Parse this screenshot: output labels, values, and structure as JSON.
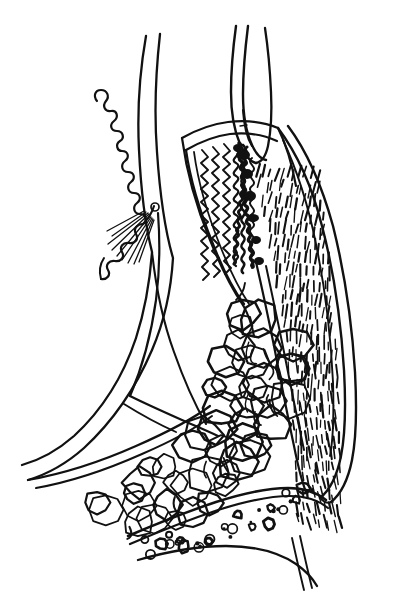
{
  "figure": {
    "kind": "anatomical-line-drawing",
    "style": "black ink pen-and-ink hatching on white",
    "background_color": "#ffffff",
    "ink_color": "#111111",
    "width": 411,
    "height": 602,
    "has_visible_text": false,
    "visible_text": "",
    "caption": ""
  },
  "palette": {
    "background": "#ffffff",
    "ink": "#111111",
    "hatch": "#111111",
    "stipple": "#111111",
    "scribble_band": "#000000"
  },
  "regions": [
    {
      "id": "crenulated-flap",
      "label": "Crenulated wavy flap (upper left)",
      "description": "Scalloped, wavy-edged tissue lobe rising at the upper left of the figure",
      "bbox": [
        88,
        88,
        60,
        180
      ],
      "stroke_width": 2.0
    },
    {
      "id": "long-left-contour",
      "label": "Long sweeping left contour",
      "description": "Double-line contour sweeping from the top center down and left to the lower left corner",
      "bbox": [
        18,
        35,
        180,
        430
      ],
      "stroke_width": 2.2
    },
    {
      "id": "radiating-rays",
      "label": "Fan of radiating short lines",
      "description": "Short straight rays fanning downward-left from a small node",
      "bbox": [
        100,
        205,
        45,
        55
      ],
      "ray_count": 9
    },
    {
      "id": "small-node",
      "label": "Small open circle node",
      "description": "Tiny open circle marker at the hinge of the fan of rays",
      "bbox": [
        151,
        203,
        9,
        9
      ]
    },
    {
      "id": "upper-tube",
      "label": "Tubular structure entering from top",
      "description": "Narrow double-walled tube descending from the top edge and curving back up",
      "bbox": [
        226,
        28,
        48,
        160
      ],
      "stroke_width": 2.2
    },
    {
      "id": "mucosal-folds",
      "label": "Wavy mucosal folds (zigzag lines)",
      "description": "Three nested zigzag/serpentine lines running diagonally down-right inside the wall",
      "bbox": [
        185,
        140,
        90,
        120
      ],
      "fold_count": 3
    },
    {
      "id": "scribble-band",
      "label": "Dense black scribbled band",
      "description": "Heavy irregular black scribble marking a thickened transition zone",
      "bbox": [
        232,
        140,
        42,
        145
      ]
    },
    {
      "id": "hatched-muscle",
      "label": "Hatched muscle layer",
      "description": "Wide band of short parallel dashes in many rows, angled, filling the right wall",
      "bbox": [
        248,
        160,
        110,
        370
      ],
      "row_count": 26,
      "dashes_per_row": 11
    },
    {
      "id": "right-outer-wall",
      "label": "Right outer wall double contour",
      "description": "Two long parallel contour lines forming the outer boundary on the right",
      "bbox": [
        255,
        60,
        130,
        470
      ],
      "stroke_width": 2.2
    },
    {
      "id": "fat-lobules",
      "label": "Lobular fat tissue",
      "description": "Cluster of rounded bubble-like lobules filling the lower central area",
      "bbox": [
        110,
        300,
        180,
        240
      ],
      "lobule_count": 46
    },
    {
      "id": "stippled-band",
      "label": "Stippled lower band",
      "description": "Band at the bottom containing small open circles, rings and dots",
      "bbox": [
        135,
        495,
        175,
        70
      ],
      "stipple_count": 32
    },
    {
      "id": "lower-sweep",
      "label": "Lower sweeping contours",
      "description": "Curved lines sweeping from lower left up to the right forming the base boundary",
      "bbox": [
        25,
        430,
        320,
        140
      ]
    }
  ]
}
